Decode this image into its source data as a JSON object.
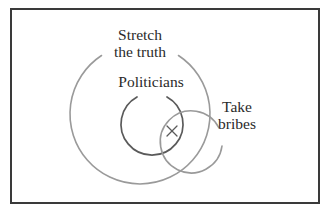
{
  "diagram": {
    "type": "venn",
    "sets": [
      {
        "id": "stretch",
        "label_lines": [
          "Stretch",
          "the truth"
        ],
        "label": "Stretch the truth",
        "stroke": "#9a9a9a"
      },
      {
        "id": "politicians",
        "label": "Politicians",
        "stroke": "#5a5a5a"
      },
      {
        "id": "bribes",
        "label_lines": [
          "Take",
          "bribes"
        ],
        "label": "Take bribes",
        "stroke": "#9a9a9a"
      }
    ],
    "marker": {
      "symbol": "×",
      "region": "Politicians ∩ Take bribes ∩ Stretch the truth",
      "color": "#5a5a5a"
    },
    "frame_color": "#3a3a3a",
    "background": "#ffffff"
  }
}
